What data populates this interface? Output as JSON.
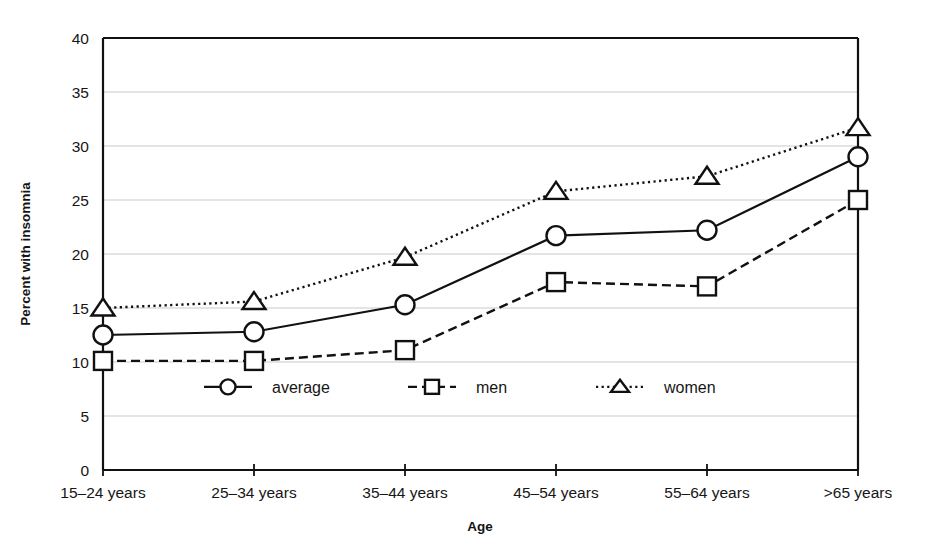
{
  "chart_data": {
    "type": "line",
    "title": "",
    "xlabel": "Age",
    "ylabel": "Percent with insomnia",
    "categories": [
      "15–24 years",
      "25–34 years",
      "35–44 years",
      "45–54 years",
      "55–64 years",
      ">65 years"
    ],
    "ylim": [
      0,
      40
    ],
    "yticks": [
      0,
      5,
      10,
      15,
      20,
      25,
      30,
      35,
      40
    ],
    "ytick_labels": [
      "0",
      "5",
      "10",
      "15",
      "20",
      "25",
      "30",
      "35",
      "40"
    ],
    "grid": true,
    "legend_position": "inside-bottom-center",
    "series": [
      {
        "name": "average",
        "marker": "circle",
        "linestyle": "solid",
        "values": [
          12.5,
          12.8,
          15.3,
          21.7,
          22.2,
          29.0
        ]
      },
      {
        "name": "men",
        "marker": "square",
        "linestyle": "dashed",
        "values": [
          10.1,
          10.1,
          11.1,
          17.4,
          17.0,
          25.0
        ]
      },
      {
        "name": "women",
        "marker": "triangle",
        "linestyle": "dotted",
        "values": [
          15.0,
          15.6,
          19.7,
          25.8,
          27.2,
          31.7
        ]
      }
    ],
    "colors": {
      "line": "#111111",
      "grid": "#c9c9c9",
      "axis": "#111111",
      "marker_fill": "#ffffff",
      "background": "#ffffff"
    }
  }
}
